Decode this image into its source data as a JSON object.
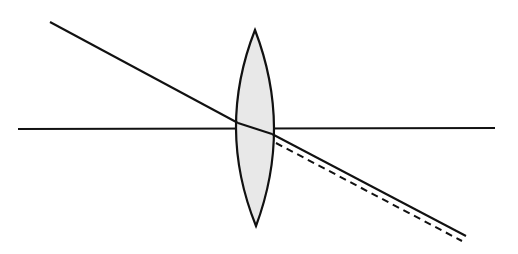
{
  "diagram": {
    "title": "",
    "colors": {
      "background": "#ffffff",
      "stroke": "#111111",
      "lens_fill": "#e8e8e8"
    },
    "optical_axis": {
      "x1": 18,
      "y1": 129,
      "x2": 495,
      "y2": 128
    },
    "lens": {
      "top": {
        "x": 255,
        "y": 30
      },
      "bottom": {
        "x": 256,
        "y": 226
      },
      "left_bulge_x": 236,
      "right_bulge_x": 274
    },
    "incident_ray": {
      "x1": 50,
      "y1": 22,
      "x2": 238,
      "y2": 123
    },
    "ray_inside_lens": {
      "x1": 238,
      "y1": 123,
      "x2": 272,
      "y2": 134
    },
    "refracted_ray": {
      "x1": 272,
      "y1": 134,
      "x2": 466,
      "y2": 236
    },
    "undeviated_extension_dashed": {
      "x1": 276,
      "y1": 143,
      "x2": 462,
      "y2": 241
    }
  }
}
